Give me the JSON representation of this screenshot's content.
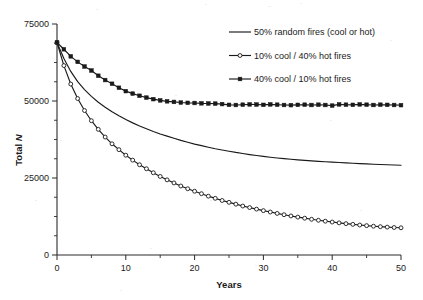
{
  "chart_data": {
    "type": "line",
    "title": "",
    "subtitle": "",
    "xlabel": "Years",
    "ylabel": "Total N",
    "ylabel_plain": "Total",
    "ylabel_italic": "N",
    "xlim": [
      0,
      50
    ],
    "ylim": [
      0,
      75000
    ],
    "xticks": [
      0,
      10,
      20,
      30,
      40,
      50
    ],
    "xtick_labels": [
      "0",
      "10",
      "20",
      "30",
      "40",
      "50"
    ],
    "xticks_minor": [
      5,
      15,
      25,
      35,
      45
    ],
    "yticks": [
      0,
      25000,
      50000,
      75000
    ],
    "ytick_labels": [
      "0",
      "25000",
      "50000",
      "75000"
    ],
    "yticks_minor": [
      6250,
      12500,
      18750,
      31250,
      37500,
      43750,
      56250,
      62500,
      68750
    ],
    "grid": false,
    "legend_position": "top-right",
    "x": [
      0,
      1,
      2,
      3,
      4,
      5,
      6,
      7,
      8,
      9,
      10,
      11,
      12,
      13,
      14,
      15,
      16,
      17,
      18,
      19,
      20,
      21,
      22,
      23,
      24,
      25,
      26,
      27,
      28,
      29,
      30,
      31,
      32,
      33,
      34,
      35,
      36,
      37,
      38,
      39,
      40,
      41,
      42,
      43,
      44,
      45,
      46,
      47,
      48,
      49,
      50
    ],
    "series": [
      {
        "name": "50% random fires (cool or hot)",
        "marker": "none",
        "line": "solid",
        "color": "#1a1a1a",
        "values": [
          69000,
          63800,
          59600,
          56300,
          53700,
          51500,
          49600,
          48000,
          46500,
          45200,
          44000,
          42900,
          41900,
          41000,
          40100,
          39300,
          38600,
          37900,
          37200,
          36600,
          36000,
          35500,
          35000,
          34500,
          34100,
          33700,
          33300,
          32950,
          32600,
          32300,
          32000,
          31750,
          31500,
          31280,
          31080,
          30900,
          30730,
          30570,
          30420,
          30280,
          30150,
          30020,
          29900,
          29790,
          29680,
          29580,
          29480,
          29390,
          29300,
          29220,
          29150
        ]
      },
      {
        "name": "10% cool / 40% hot fires",
        "marker": "open-circle",
        "line": "solid",
        "color": "#1a1a1a",
        "values": [
          69000,
          61500,
          55500,
          50800,
          46900,
          43600,
          40800,
          38300,
          36100,
          34200,
          32400,
          30800,
          29300,
          28000,
          26700,
          25500,
          24400,
          23400,
          22400,
          21500,
          20700,
          19900,
          19100,
          18400,
          17700,
          17100,
          16500,
          15900,
          15400,
          14900,
          14400,
          13950,
          13500,
          13080,
          12680,
          12300,
          11950,
          11600,
          11280,
          10980,
          10700,
          10430,
          10180,
          9950,
          9730,
          9530,
          9350,
          9190,
          9050,
          8930,
          8830
        ]
      },
      {
        "name": "40% cool / 10% hot fires",
        "marker": "filled-square",
        "line": "solid",
        "color": "#1a1a1a",
        "values": [
          69000,
          66800,
          64500,
          62700,
          61200,
          59900,
          58200,
          56800,
          55600,
          54300,
          53200,
          52400,
          51700,
          51100,
          50600,
          50200,
          49900,
          49700,
          49500,
          49400,
          49350,
          49250,
          49200,
          49150,
          49000,
          48750,
          48700,
          48800,
          48900,
          48850,
          48750,
          48900,
          48800,
          48700,
          48650,
          48750,
          48800,
          48700,
          48800,
          48700,
          48500,
          48900,
          48800,
          48750,
          48900,
          48800,
          48700,
          48800,
          48750,
          48700,
          48650
        ]
      }
    ]
  },
  "legend": {
    "entries": [
      {
        "label": "50% random fires (cool or hot)",
        "marker": "none"
      },
      {
        "label": "10% cool / 40% hot fires",
        "marker": "open-circle"
      },
      {
        "label": "40% cool / 10% hot fires",
        "marker": "filled-square"
      }
    ]
  }
}
